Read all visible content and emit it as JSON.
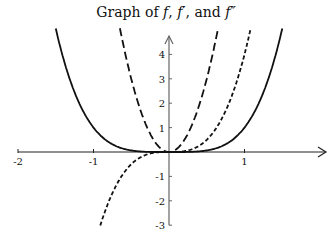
{
  "chart_data": {
    "type": "line",
    "title": "Graph of f, f′, and f″",
    "title_parts": [
      "Graph of ",
      "f",
      ", ",
      "f′",
      ", and ",
      "f″"
    ],
    "xlabel": "",
    "ylabel": "",
    "xlim": [
      -2,
      2
    ],
    "ylim": [
      -3,
      5
    ],
    "x_ticks": [
      -2,
      -1,
      1
    ],
    "x_tick_labels": [
      "-2",
      "-1",
      "1"
    ],
    "y_ticks": [
      -3,
      -2,
      -1,
      1,
      2,
      3,
      4
    ],
    "y_tick_labels": [
      "-3",
      "-2",
      "-1",
      "1",
      "2",
      "3",
      "4"
    ],
    "grid": false,
    "legend": null,
    "series": [
      {
        "name": "f",
        "formula": "x^4",
        "style": "solid",
        "x": [
          -1.5,
          -1.25,
          -1,
          -0.75,
          -0.5,
          -0.25,
          0,
          0.25,
          0.5,
          0.75,
          1,
          1.25,
          1.5
        ],
        "values": [
          5.06,
          2.44,
          1,
          0.32,
          0.06,
          0.0,
          0,
          0.0,
          0.06,
          0.32,
          1,
          2.44,
          5.06
        ]
      },
      {
        "name": "f′",
        "formula": "4x^3",
        "style": "short-dash",
        "x": [
          -0.91,
          -0.75,
          -0.5,
          -0.25,
          0,
          0.25,
          0.5,
          0.75,
          1,
          1.08
        ],
        "values": [
          -3.0,
          -1.69,
          -0.5,
          -0.06,
          0,
          0.06,
          0.5,
          1.69,
          4,
          5.04
        ]
      },
      {
        "name": "f″",
        "formula": "12x^2",
        "style": "long-dash",
        "x": [
          -0.65,
          -0.5,
          -0.25,
          0,
          0.25,
          0.5,
          0.65
        ],
        "values": [
          5.07,
          3,
          0.75,
          0,
          0.75,
          3,
          5.07
        ]
      }
    ]
  }
}
